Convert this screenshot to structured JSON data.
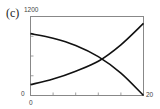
{
  "panel_label": "(c)",
  "axes": {
    "y_top_label": "1200",
    "y_bottom_label": "0",
    "x_left_label": "0",
    "x_right_label": "20"
  },
  "chart_data": {
    "type": "line",
    "title": "",
    "xlabel": "",
    "ylabel": "",
    "xlim": [
      0,
      20
    ],
    "ylim": [
      0,
      1200
    ],
    "x_ticks": [
      0,
      4,
      8,
      12,
      16,
      20
    ],
    "y_ticks": [
      0,
      300,
      600,
      900,
      1200
    ],
    "grid": false,
    "legend": null,
    "series": [
      {
        "name": "decreasing",
        "x": [
          0,
          4,
          8,
          12,
          16,
          20
        ],
        "values": [
          940,
          870,
          760,
          590,
          340,
          0
        ]
      },
      {
        "name": "increasing",
        "x": [
          0,
          4,
          8,
          12,
          16,
          20
        ],
        "values": [
          165,
          250,
          370,
          520,
          770,
          1095
        ]
      }
    ],
    "annotations": [
      {
        "text": "intersection",
        "x": 12.7,
        "y": 547
      }
    ]
  }
}
